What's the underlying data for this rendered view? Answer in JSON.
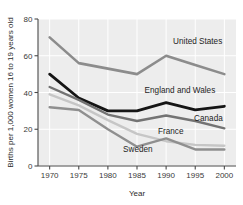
{
  "chart_data": {
    "type": "line",
    "title": "",
    "xlabel": "Year",
    "ylabel": "Births per 1,000 women 16 to 19 years old",
    "x": [
      1970,
      1975,
      1980,
      1985,
      1990,
      1995,
      2000
    ],
    "xlim": [
      1968,
      2002
    ],
    "ylim": [
      0,
      80
    ],
    "xticks": [
      "1970",
      "1975",
      "1980",
      "1985",
      "1990",
      "1995",
      "2000"
    ],
    "yticks": [
      "0",
      "20",
      "40",
      "60",
      "80"
    ],
    "grid": true,
    "legend": "inline-labels",
    "series": [
      {
        "name": "United States",
        "color": "#8c8c8c",
        "width": 2.6,
        "values": [
          70,
          56,
          53,
          50,
          60,
          55,
          50
        ],
        "label_x": 1991.2,
        "label_y": 66.5,
        "label_anchor": "start"
      },
      {
        "name": "England and Wales",
        "color": "#151515",
        "width": 2.8,
        "values": [
          50,
          37,
          30,
          30,
          34.5,
          30.5,
          32.5
        ],
        "label_x": 1986.3,
        "label_y": 39.5,
        "label_anchor": "start"
      },
      {
        "name": "Canada",
        "color": "#737373",
        "width": 2.4,
        "values": [
          43,
          36,
          28,
          24.5,
          27.5,
          24.5,
          20.5
        ],
        "label_x": 1994.8,
        "label_y": 24.5,
        "label_anchor": "start"
      },
      {
        "name": "France",
        "color": "#c6c6c6",
        "width": 2.4,
        "values": [
          39,
          33,
          25,
          17.5,
          13.5,
          11.5,
          11
        ],
        "label_x": 1988.6,
        "label_y": 17.5,
        "label_anchor": "start"
      },
      {
        "name": "Sweden",
        "color": "#8f8f8f",
        "width": 2.4,
        "values": [
          32,
          30.5,
          20,
          10.5,
          15,
          9,
          9
        ],
        "label_x": 1982.6,
        "label_y": 7.5,
        "label_anchor": "start"
      }
    ],
    "style": {
      "plot_background": "#ededed",
      "gridline_color": "#ffffff",
      "axis_color": "#4a4a4a",
      "page_background": "#ffffff"
    }
  }
}
